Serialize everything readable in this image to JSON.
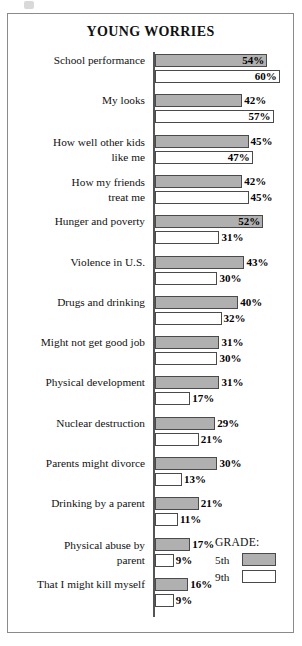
{
  "chart_data": {
    "type": "bar",
    "title": "YOUNG WORRIES",
    "xlabel": "",
    "ylabel": "",
    "orientation": "horizontal",
    "grid": false,
    "axis_range": [
      0,
      60
    ],
    "value_suffix": "%",
    "legend": {
      "title": "GRADE:",
      "position": "bottom-right",
      "entries": [
        {
          "label": "5th",
          "swatch": "gray"
        },
        {
          "label": "9th",
          "swatch": "white"
        }
      ]
    },
    "categories": [
      "School performance",
      "My looks",
      "How well other kids like me",
      "How my friends treat me",
      "Hunger and poverty",
      "Violence in U.S.",
      "Drugs and drinking",
      "Might not get good job",
      "Physical development",
      "Nuclear destruction",
      "Parents might divorce",
      "Drinking by a parent",
      "Physical abuse by parent",
      "That I might kill myself"
    ],
    "series": [
      {
        "name": "5th",
        "values": [
          54,
          42,
          45,
          42,
          52,
          43,
          40,
          31,
          31,
          29,
          30,
          21,
          17,
          16
        ]
      },
      {
        "name": "9th",
        "values": [
          60,
          57,
          47,
          45,
          31,
          30,
          32,
          30,
          17,
          21,
          13,
          11,
          9,
          9
        ]
      }
    ]
  },
  "rows": [
    {
      "label_lines": [
        "School performance"
      ],
      "bars": [
        {
          "series": "5th",
          "value": "54%",
          "pct": 54,
          "label_pos": "inside"
        },
        {
          "series": "9th",
          "value": "60%",
          "pct": 60,
          "label_pos": "inside"
        }
      ]
    },
    {
      "label_lines": [
        "My looks"
      ],
      "bars": [
        {
          "series": "5th",
          "value": "42%",
          "pct": 42,
          "label_pos": "outside"
        },
        {
          "series": "9th",
          "value": "57%",
          "pct": 57,
          "label_pos": "inside"
        }
      ]
    },
    {
      "label_lines": [
        "How well other kids",
        "like me"
      ],
      "bars": [
        {
          "series": "5th",
          "value": "45%",
          "pct": 45,
          "label_pos": "outside"
        },
        {
          "series": "9th",
          "value": "47%",
          "pct": 47,
          "label_pos": "inside"
        }
      ]
    },
    {
      "label_lines": [
        "How my friends",
        "treat me"
      ],
      "bars": [
        {
          "series": "5th",
          "value": "42%",
          "pct": 42,
          "label_pos": "outside"
        },
        {
          "series": "9th",
          "value": "45%",
          "pct": 45,
          "label_pos": "outside"
        }
      ]
    },
    {
      "label_lines": [
        "Hunger and poverty"
      ],
      "bars": [
        {
          "series": "5th",
          "value": "52%",
          "pct": 52,
          "label_pos": "inside"
        },
        {
          "series": "9th",
          "value": "31%",
          "pct": 31,
          "label_pos": "outside"
        }
      ]
    },
    {
      "label_lines": [
        "Violence in U.S."
      ],
      "bars": [
        {
          "series": "5th",
          "value": "43%",
          "pct": 43,
          "label_pos": "outside"
        },
        {
          "series": "9th",
          "value": "30%",
          "pct": 30,
          "label_pos": "outside"
        }
      ]
    },
    {
      "label_lines": [
        "Drugs and drinking"
      ],
      "bars": [
        {
          "series": "5th",
          "value": "40%",
          "pct": 40,
          "label_pos": "outside"
        },
        {
          "series": "9th",
          "value": "32%",
          "pct": 32,
          "label_pos": "outside"
        }
      ]
    },
    {
      "label_lines": [
        "Might not get good job"
      ],
      "bars": [
        {
          "series": "5th",
          "value": "31%",
          "pct": 31,
          "label_pos": "outside"
        },
        {
          "series": "9th",
          "value": "30%",
          "pct": 30,
          "label_pos": "outside"
        }
      ]
    },
    {
      "label_lines": [
        "Physical development"
      ],
      "bars": [
        {
          "series": "5th",
          "value": "31%",
          "pct": 31,
          "label_pos": "outside"
        },
        {
          "series": "9th",
          "value": "17%",
          "pct": 17,
          "label_pos": "outside"
        }
      ]
    },
    {
      "label_lines": [
        "Nuclear destruction"
      ],
      "bars": [
        {
          "series": "5th",
          "value": "29%",
          "pct": 29,
          "label_pos": "outside"
        },
        {
          "series": "9th",
          "value": "21%",
          "pct": 21,
          "label_pos": "outside"
        }
      ]
    },
    {
      "label_lines": [
        "Parents might divorce"
      ],
      "bars": [
        {
          "series": "5th",
          "value": "30%",
          "pct": 30,
          "label_pos": "outside"
        },
        {
          "series": "9th",
          "value": "13%",
          "pct": 13,
          "label_pos": "outside"
        }
      ]
    },
    {
      "label_lines": [
        "Drinking by a parent"
      ],
      "bars": [
        {
          "series": "5th",
          "value": "21%",
          "pct": 21,
          "label_pos": "outside"
        },
        {
          "series": "9th",
          "value": "11%",
          "pct": 11,
          "label_pos": "outside"
        }
      ]
    },
    {
      "label_lines": [
        "Physical abuse by",
        "parent"
      ],
      "bars": [
        {
          "series": "5th",
          "value": "17%",
          "pct": 17,
          "label_pos": "outside"
        },
        {
          "series": "9th",
          "value": "9%",
          "pct": 9,
          "label_pos": "outside"
        }
      ]
    },
    {
      "label_lines": [
        "That I might kill myself"
      ],
      "bars": [
        {
          "series": "5th",
          "value": "16%",
          "pct": 16,
          "label_pos": "outside"
        },
        {
          "series": "9th",
          "value": "9%",
          "pct": 9,
          "label_pos": "outside"
        }
      ]
    }
  ]
}
